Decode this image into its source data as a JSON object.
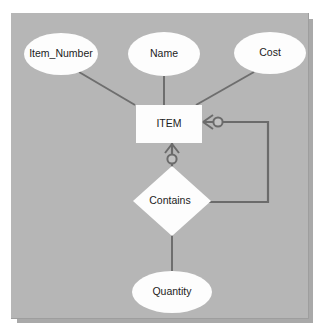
{
  "diagram": {
    "type": "entity-relationship-diagram",
    "background_color": "#b6b6b6",
    "shape_fill_color": "#fdfdfd",
    "line_color": "#6b6b6b",
    "text_color": "#1c1c1c",
    "entities": [
      {
        "id": "item",
        "label": "ITEM",
        "shape": "rectangle"
      }
    ],
    "relationships": [
      {
        "id": "contains",
        "label": "Contains",
        "shape": "diamond"
      }
    ],
    "attributes": [
      {
        "id": "item_number",
        "label": "Item_Number",
        "shape": "ellipse",
        "owner": "ITEM"
      },
      {
        "id": "name",
        "label": "Name",
        "shape": "ellipse",
        "owner": "ITEM"
      },
      {
        "id": "cost",
        "label": "Cost",
        "shape": "ellipse",
        "owner": "ITEM"
      },
      {
        "id": "quantity",
        "label": "Quantity",
        "shape": "ellipse",
        "owner": "Contains"
      }
    ],
    "connections": [
      {
        "from": "Item_Number",
        "to": "ITEM",
        "notation": "plain"
      },
      {
        "from": "Name",
        "to": "ITEM",
        "notation": "plain"
      },
      {
        "from": "Cost",
        "to": "ITEM",
        "notation": "plain"
      },
      {
        "from": "ITEM",
        "to": "Contains",
        "notation": "zero-or-many",
        "path": "vertical"
      },
      {
        "from": "ITEM",
        "to": "Contains",
        "notation": "zero-or-many",
        "path": "right-routed"
      },
      {
        "from": "Contains",
        "to": "Quantity",
        "notation": "plain"
      }
    ]
  }
}
